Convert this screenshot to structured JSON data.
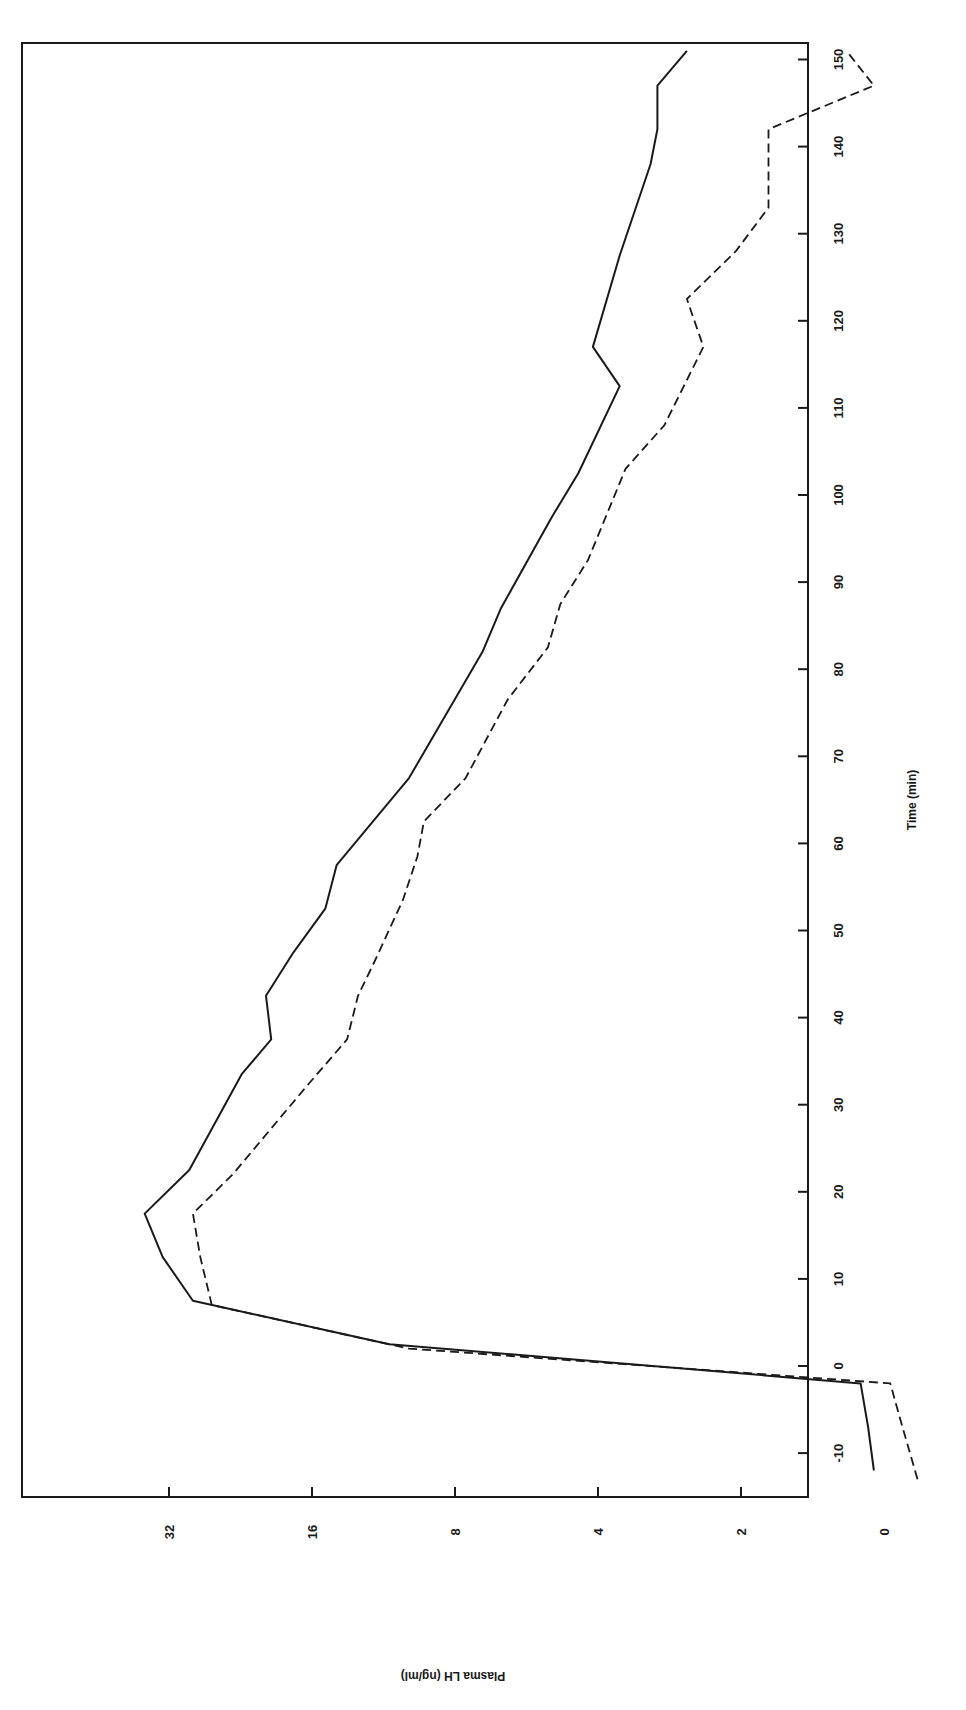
{
  "chart_data": {
    "type": "line",
    "orientation": "rotated-90-clockwise",
    "title": "",
    "xlabel": "Time (min)",
    "ylabel": "Plasma LH (ng/ml)",
    "x_ticks": [
      -10,
      0,
      10,
      20,
      30,
      40,
      50,
      60,
      70,
      80,
      90,
      100,
      110,
      120,
      130,
      140,
      150
    ],
    "x_tick_labels": [
      "-10",
      "0",
      "10",
      "20",
      "30",
      "40",
      "50",
      "60",
      "70",
      "80",
      "90",
      "100",
      "110",
      "120",
      "130",
      "140",
      "150"
    ],
    "xlim": [
      -15,
      152
    ],
    "y_scale": "log2",
    "y_ticks": [
      1,
      2,
      4,
      8,
      16,
      32
    ],
    "y_tick_labels": [
      "0",
      "2",
      "4",
      "8",
      "16",
      "32"
    ],
    "ylim": [
      1,
      90
    ],
    "grid": false,
    "legend": null,
    "series": [
      {
        "name": "solid",
        "style": "solid",
        "x": [
          -12,
          -7,
          -2,
          2.5,
          7.5,
          12.5,
          17.5,
          22.5,
          33.5,
          37.5,
          42.5,
          47.5,
          52.5,
          57.5,
          67.5,
          82,
          87,
          97.5,
          102.5,
          112.5,
          117,
          127.5,
          138,
          142,
          147,
          151
        ],
        "values": [
          1.05,
          1.08,
          1.12,
          11,
          28.5,
          33,
          36,
          29,
          22.5,
          19.5,
          20,
          17.5,
          15,
          14.2,
          10,
          7,
          6.4,
          5,
          4.4,
          3.6,
          4.1,
          3.6,
          3.1,
          3.0,
          3.0,
          2.6
        ]
      },
      {
        "name": "dashed",
        "style": "dashed",
        "x": [
          -13,
          -6.5,
          -2,
          2,
          7,
          12.5,
          17.5,
          22,
          32,
          37.5,
          42.5,
          46.5,
          53.5,
          58.5,
          62.5,
          67.5,
          76.5,
          82.5,
          87.5,
          92.5,
          103,
          108,
          117,
          122.5,
          128,
          133,
          142,
          147,
          151
        ],
        "values": [
          0.85,
          0.92,
          0.97,
          10,
          26,
          27.5,
          28.5,
          23.5,
          16.5,
          13.5,
          12.8,
          11.8,
          10.3,
          9.6,
          9.3,
          7.6,
          6.2,
          5.1,
          4.8,
          4.2,
          3.5,
          2.9,
          2.4,
          2.6,
          2.05,
          1.75,
          1.75,
          1.05,
          1.2
        ]
      }
    ]
  },
  "layout": {
    "frame": {
      "left": 22,
      "top": 43,
      "right": 808,
      "bottom": 1497
    },
    "time_axis": {
      "zero_px": 1366,
      "px_per_min": 8.71
    },
    "lh_axis": {
      "one_px": 884,
      "px_per_doubling": 143
    },
    "line_color": "#1a1a1a"
  }
}
